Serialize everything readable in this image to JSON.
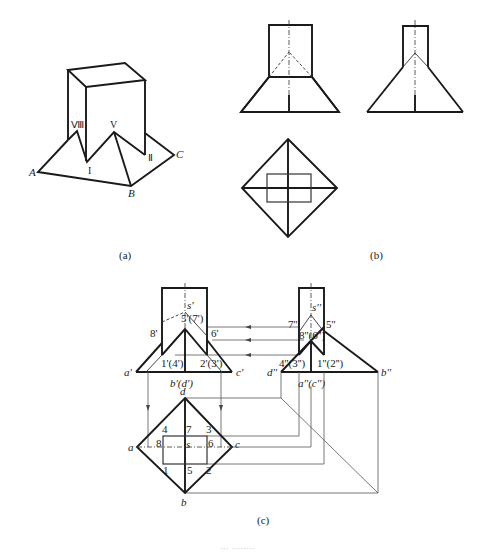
{
  "figure": {
    "panel_a": {
      "caption": "(a)",
      "points": {
        "A": "A",
        "B": "B",
        "C": "C"
      },
      "roman": {
        "VIII": "Ⅷ",
        "V": "V",
        "I": "I",
        "II": "Ⅱ"
      }
    },
    "panel_b": {
      "caption": "(b)"
    },
    "panel_c": {
      "caption": "(c)",
      "front_view": {
        "s": "s'",
        "p5": "5'(7')",
        "p8": "8'",
        "p6": "6'",
        "p1": "1'(4')",
        "p2": "2'(3')",
        "a": "a'",
        "c": "c'",
        "bd": "b'(d')"
      },
      "side_view": {
        "s": "s''",
        "p7": "7''",
        "p5": "5''",
        "p86": "8''(6'')",
        "p43": "4''(3'')",
        "p12": "1''(2'')",
        "d": "d''",
        "b": "b''",
        "ac": "a''(c'')"
      },
      "top_view": {
        "d": "d",
        "a": "a",
        "c": "c",
        "b": "b",
        "s": "s",
        "p4": "4",
        "p7": "7",
        "p3": "3",
        "p8": "8",
        "p6": "6",
        "p1": "1",
        "p5": "5",
        "p2": "2"
      }
    },
    "footer_caption": "··· ········"
  }
}
